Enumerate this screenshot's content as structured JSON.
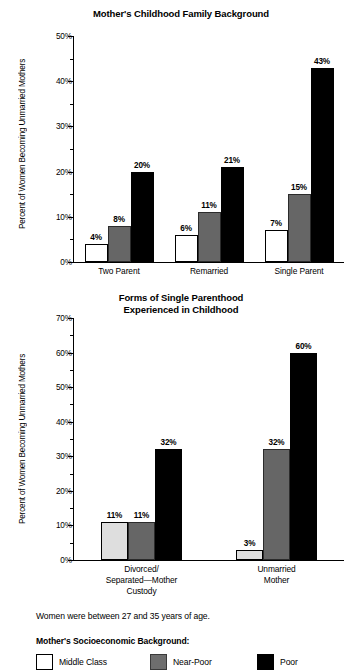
{
  "figure": {
    "footnote": "Women were between 27 and 35 years of age.",
    "legend_title": "Mother's Socioeconomic Background:",
    "legend": [
      {
        "key": "middle",
        "label": "Middle Class",
        "color": "#ffffff"
      },
      {
        "key": "near",
        "label": "Near-Poor",
        "color": "#6e6e6e"
      },
      {
        "key": "poor",
        "label": "Poor",
        "color": "#000000"
      }
    ]
  },
  "chart_data": [
    {
      "type": "bar",
      "title": "Mother's Childhood Family Background",
      "xlabel": "",
      "ylabel": "Percent of Women Becoming Unmarried Mothers",
      "ylim": [
        0,
        50
      ],
      "ytick_step": 10,
      "yminor_step": 5,
      "ytick_labels": [
        "0%",
        "10%",
        "20%",
        "30%",
        "40%",
        "50%"
      ],
      "grid": false,
      "legend_position": "below-figure",
      "categories": [
        "Two Parent",
        "Remarried",
        "Single Parent"
      ],
      "series": [
        {
          "name": "Middle Class",
          "values": [
            4,
            6,
            7
          ],
          "labels": [
            "4%",
            "6%",
            "7%"
          ]
        },
        {
          "name": "Near-Poor",
          "values": [
            8,
            11,
            15
          ],
          "labels": [
            "8%",
            "11%",
            "15%"
          ]
        },
        {
          "name": "Poor",
          "values": [
            20,
            21,
            43
          ],
          "labels": [
            "20%",
            "21%",
            "43%"
          ]
        }
      ]
    },
    {
      "type": "bar",
      "title_line1": "Forms of Single Parenthood",
      "title_line2": "Experienced in Childhood",
      "title": "Forms of Single Parenthood Experienced in Childhood",
      "xlabel": "",
      "ylabel": "Percent of Women Becoming Unmarried Mothers",
      "ylim": [
        0,
        70
      ],
      "ytick_step": 10,
      "yminor_step": 5,
      "ytick_labels": [
        "0%",
        "10%",
        "20%",
        "30%",
        "40%",
        "50%",
        "60%",
        "70%"
      ],
      "grid": false,
      "legend_position": "below-figure",
      "categories": [
        "Divorced/ Separated—Mother Custody",
        "Unmarried Mother"
      ],
      "category_lines": [
        [
          "Divorced/",
          "Separated—Mother",
          "Custody"
        ],
        [
          "Unmarried",
          "Mother"
        ]
      ],
      "series": [
        {
          "name": "Middle Class",
          "values": [
            11,
            3
          ],
          "labels": [
            "11%",
            "3%"
          ]
        },
        {
          "name": "Near-Poor",
          "values": [
            11,
            32
          ],
          "labels": [
            "11%",
            "32%"
          ]
        },
        {
          "name": "Poor",
          "values": [
            32,
            60
          ],
          "labels": [
            "32%",
            "60%"
          ]
        }
      ]
    }
  ]
}
